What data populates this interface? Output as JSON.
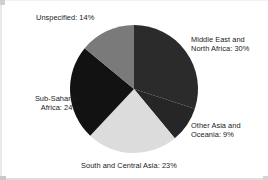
{
  "chart_data": {
    "type": "pie",
    "title": "",
    "subtitle": "",
    "xlabel": "",
    "ylabel": "",
    "legend_position": "none",
    "grid": false,
    "start_angle_deg": 0,
    "direction": "clockwise",
    "units": "percent",
    "categories": [
      "Middle East and North Africa",
      "Other Asia and Oceania",
      "South and Central Asia",
      "Sub-Saharan Africa",
      "Unspecified"
    ],
    "values": [
      30,
      9,
      23,
      24,
      14
    ],
    "colors": [
      "#2b2b2b",
      "#262626",
      "#dcdcdc",
      "#121212",
      "#7a7a7a"
    ],
    "slices": [
      {
        "name": "middle-east-north-africa",
        "label_line1": "Middle East and",
        "label_line2": "North Africa: 30%",
        "label_text": "Middle East and\nNorth Africa: 30%",
        "value": 30,
        "color": "#2b2b2b"
      },
      {
        "name": "other-asia-oceania",
        "label_line1": "Other Asia and",
        "label_line2": "Oceania: 9%",
        "label_text": "Other Asia and\nOceania: 9%",
        "value": 9,
        "color": "#262626"
      },
      {
        "name": "south-central-asia",
        "label_line1": "South and Central Asia: 23%",
        "label_line2": "",
        "label_text": "South and Central Asia: 23%",
        "value": 23,
        "color": "#dcdcdc"
      },
      {
        "name": "sub-saharan-africa",
        "label_line1": "Sub-Saharan",
        "label_line2": "Africa: 24%",
        "label_text": "Sub-Saharan\nAfrica: 24%",
        "value": 24,
        "color": "#121212"
      },
      {
        "name": "unspecified",
        "label_line1": "Unspecified: 14%",
        "label_line2": "",
        "label_text": "Unspecified: 14%",
        "value": 14,
        "color": "#7a7a7a"
      }
    ]
  },
  "figure": {
    "background": "#ffffff",
    "text_color": "#1a1a1a"
  }
}
